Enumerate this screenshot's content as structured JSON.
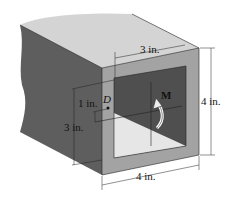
{
  "figure": {
    "colors": {
      "top_face": "#d4d4d4",
      "side_face": "#5e5e5e",
      "front_wall": "#a3a3a3",
      "inner_dark": "#4f4f4f",
      "inner_light": "#e6e6e6",
      "line": "#222222"
    },
    "labels": {
      "point": "D",
      "moment": "M"
    },
    "dimensions": {
      "inner_width": "3 in.",
      "outer_height": "4 in.",
      "outer_width": "4 in.",
      "inner_height": "3 in.",
      "point_offset": "1 in."
    }
  }
}
